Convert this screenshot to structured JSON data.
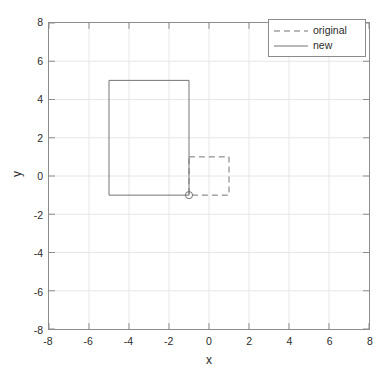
{
  "chart_data": {
    "type": "line",
    "title": "",
    "xlabel": "x",
    "ylabel": "y",
    "xlim": [
      -8,
      8
    ],
    "ylim": [
      -8,
      8
    ],
    "xticks": [
      -8,
      -6,
      -4,
      -2,
      0,
      2,
      4,
      6,
      8
    ],
    "yticks": [
      -8,
      -6,
      -4,
      -2,
      0,
      2,
      4,
      6,
      8
    ],
    "xtick_labels": [
      "-8",
      "-6",
      "-4",
      "-2",
      "0",
      "2",
      "4",
      "6",
      "8"
    ],
    "ytick_labels": [
      "8",
      "6",
      "4",
      "2",
      "0",
      "-2",
      "-4",
      "-6",
      "-8"
    ],
    "grid": true,
    "legend_position": "upper right",
    "line_color": "#737373",
    "grid_color": "#e6e6e6",
    "axis_color": "#8c8c8c",
    "series": [
      {
        "name": "original",
        "style": "dashed",
        "shape": "rectangle",
        "x": [
          -1,
          1,
          1,
          -1,
          -1
        ],
        "y": [
          1,
          1,
          -1,
          -1,
          1
        ]
      },
      {
        "name": "new",
        "style": "solid",
        "shape": "rectangle",
        "x": [
          -5,
          -1,
          -1,
          -5,
          -5
        ],
        "y": [
          5,
          5,
          -1,
          -1,
          5
        ]
      }
    ],
    "markers": [
      {
        "name": "anchor-point",
        "x": -1,
        "y": -1,
        "symbol": "circle",
        "filled": false
      }
    ]
  },
  "legend": {
    "entries": [
      {
        "label": "original",
        "style": "dashed"
      },
      {
        "label": "new",
        "style": "solid"
      }
    ]
  }
}
